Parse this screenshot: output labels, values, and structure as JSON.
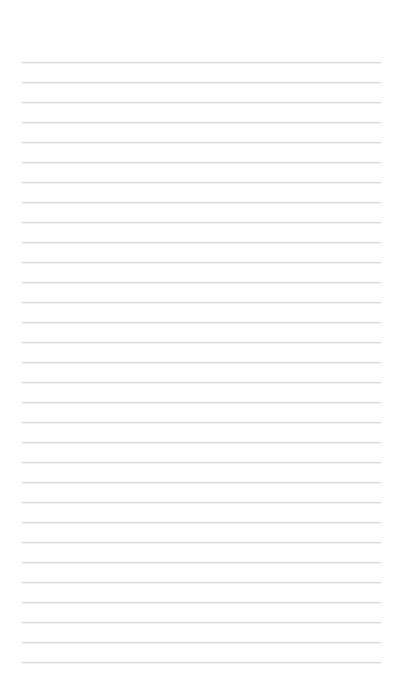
{
  "page": {
    "kind": "lined-paper",
    "width": 403,
    "height": 698,
    "background_color": "#ffffff",
    "content_text": ""
  },
  "rules": {
    "count": 31,
    "color": "#d8d9dc",
    "thickness_px": 1,
    "first_line_y": 61.5,
    "spacing_px": 20.0,
    "line_left_x": 22,
    "line_right_x": 381,
    "line_width_px": 359
  },
  "margins": {
    "top_px": 61,
    "bottom_px": 36,
    "left_px": 22,
    "right_px": 22
  }
}
